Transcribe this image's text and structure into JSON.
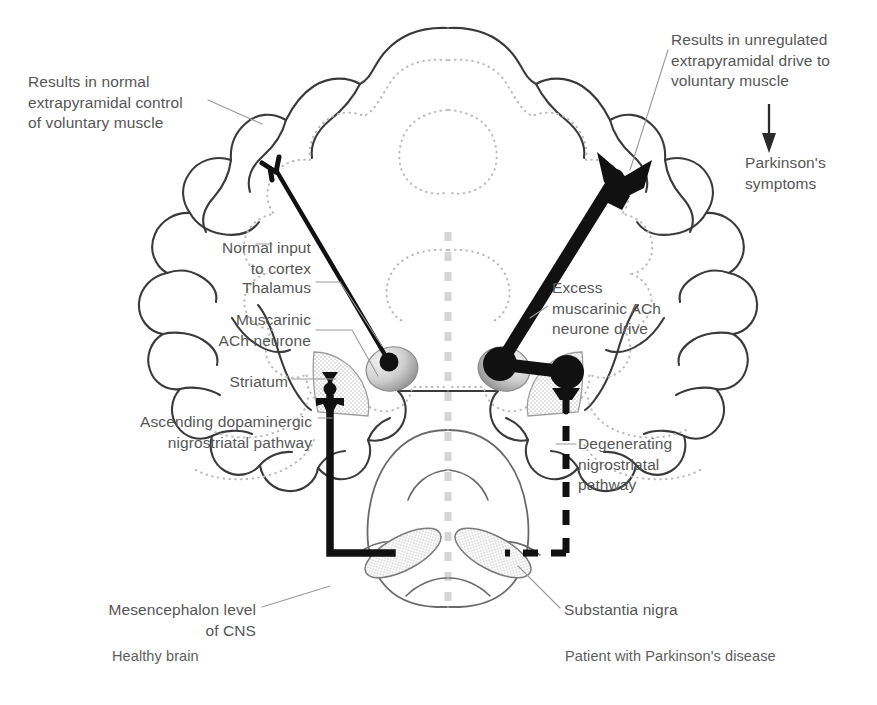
{
  "figure": {
    "title_alt": "Dopaminergic and cholinergic balance in healthy brain versus Parkinson's disease",
    "colors": {
      "text": "#565656",
      "outline": "#3a3a3a",
      "dotted_inner": "#b8b8b8",
      "neuron_black": "#111111",
      "stipple_fill": "#dedede",
      "leader_line": "#9a9a9a",
      "divider": "#d8d8d8",
      "background": "#ffffff"
    }
  },
  "panels": {
    "left": {
      "caption": "Healthy brain",
      "caption_x": 112,
      "caption_y": 648
    },
    "right": {
      "caption": "Patient with Parkinson's disease",
      "caption_x": 565,
      "caption_y": 648
    }
  },
  "labels": {
    "results_normal": {
      "text": "Results in normal\nextrapyramidal control\nof voluntary muscle",
      "x": 28,
      "y": 72,
      "align": "left"
    },
    "normal_input": {
      "text": "Normal input\nto cortex",
      "x": 185,
      "y": 238,
      "align": "right",
      "width": 126
    },
    "thalamus": {
      "text": "Thalamus",
      "x": 217,
      "y": 278,
      "align": "right",
      "width": 94
    },
    "muscarinic_ach": {
      "text": "Muscarinic\nACh neurone",
      "x": 190,
      "y": 310,
      "align": "right",
      "width": 121
    },
    "striatum": {
      "text": "Striatum",
      "x": 222,
      "y": 372,
      "align": "right",
      "width": 66
    },
    "ascending_pathway": {
      "text": "Ascending dopaminergic\nnigrostriatal pathway",
      "x": 58,
      "y": 412,
      "align": "right",
      "width": 254
    },
    "mesencephalon": {
      "text": "Mesencephalon level\nof CNS",
      "x": 100,
      "y": 600,
      "align": "right",
      "width": 156
    },
    "results_unregulated": {
      "text": "Results in unregulated\nextrapyramidal drive to\nvoluntary muscle",
      "x": 671,
      "y": 30,
      "align": "left"
    },
    "parkinsons_symptoms": {
      "text": "Parkinson's\nsymptoms",
      "x": 745,
      "y": 153,
      "align": "left"
    },
    "excess_ach": {
      "text": "Excess\nmuscarinic ACh\nneurone drive",
      "x": 552,
      "y": 278,
      "align": "left"
    },
    "degenerating_pathway": {
      "text": "Degenerating\nnigrostriatal\npathway",
      "x": 578,
      "y": 434,
      "align": "left"
    },
    "substantia_nigra": {
      "text": "Substantia nigra",
      "x": 564,
      "y": 600,
      "align": "left"
    }
  },
  "icons": {
    "down_arrow": "downward-arrow",
    "divider": "vertical-dashed-divider"
  }
}
